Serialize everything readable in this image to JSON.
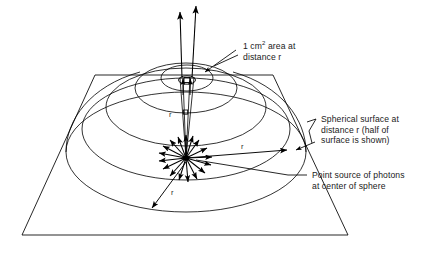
{
  "figure": {
    "name": "inverse-square-law-point-source-diagram",
    "type": "scientific-line-diagram",
    "background_color": "#ffffff",
    "ink_color": "#000000",
    "text_color": "#1a1a1a"
  },
  "labels": {
    "area": {
      "id": "area-callout",
      "line1_prefix": "1 cm",
      "line1_sup": "2",
      "line1_suffix": " area at",
      "line2": "distance r"
    },
    "surface": {
      "id": "surface-callout",
      "line1": "Spherical surface at",
      "line2": "distance r (half of",
      "line3": "surface is shown)"
    },
    "source": {
      "id": "source-callout",
      "line1": "Point source of photons",
      "line2": "at center of sphere"
    }
  },
  "radius_labels": [
    {
      "name": "r-upper",
      "text": "r"
    },
    {
      "name": "r-right",
      "text": "r"
    },
    {
      "name": "r-lower-left",
      "text": "r"
    }
  ],
  "geometry": {
    "ground_plane": "trapezoid",
    "hemisphere_contours": 4,
    "photon_arrows": 16,
    "cone_rays": 2,
    "area_patch": "1 cm squared"
  }
}
